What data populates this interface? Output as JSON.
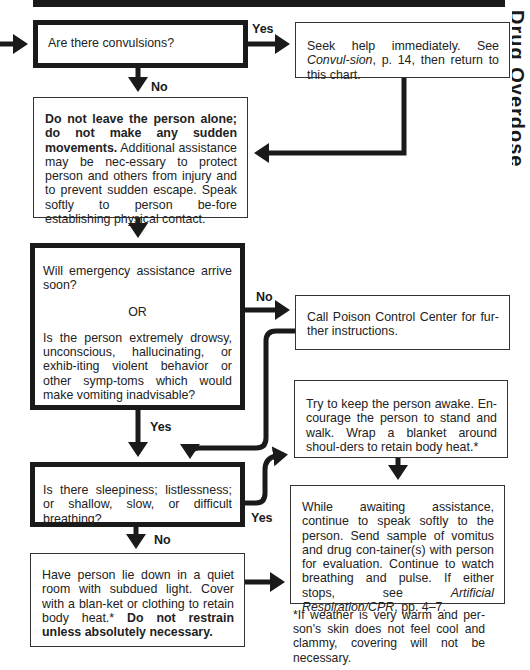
{
  "nodes": {
    "convulsions": {
      "text": "Are there convulsions?"
    },
    "seek_help": {
      "text_a": "Seek help immediately. See ",
      "text_italic": "Convul-sion",
      "text_b": ", p. 14, then return to this chart."
    },
    "do_not_leave": {
      "bold": "Do not leave the person alone; do not make any sudden movements.",
      "text": " Additional assistance may be nec-essary to protect person and others from injury and to prevent sudden escape. Speak softly to person be-fore establishing physical contact."
    },
    "emergency": {
      "q1": "Will emergency assistance arrive soon?",
      "or": "OR",
      "q2": "Is the person extremely drowsy, unconscious, hallucinating, or exhib-iting violent behavior or other symp-toms which would make vomiting inadvisable?"
    },
    "poison_control": {
      "text": "Call Poison Control Center for fur-ther instructions."
    },
    "keep_awake": {
      "text": "Try to keep the person awake. En-courage the person to stand and walk. Wrap a blanket around shoul-ders to retain body heat.*"
    },
    "sleepiness": {
      "text": "Is there sleepiness; listlessness; or shallow, slow, or difficult breathing?"
    },
    "awaiting": {
      "text": "While awaiting assistance, continue to speak softly to the person. Send sample of vomitus and drug con-tainer(s) with person for evaluation. Continue to watch breathing and pulse. If either stops, see ",
      "italic": "Artificial Respiration/CPR",
      "text_b": ", pp. 4–7."
    },
    "lie_down": {
      "text": "Have person lie down in a quiet room with subdued light. Cover with a blan-ket or clothing to retain body heat.* ",
      "bold": "Do not restrain unless absolutely necessary."
    }
  },
  "labels": {
    "yes1": "Yes",
    "no1": "No",
    "no2": "No",
    "yes2": "Yes",
    "yes3": "Yes",
    "no3": "No"
  },
  "footnote": "*If weather is very warm and per-son's skin does not feel cool and clammy, covering will not be necessary.",
  "side_tab": "Drug Overdose"
}
